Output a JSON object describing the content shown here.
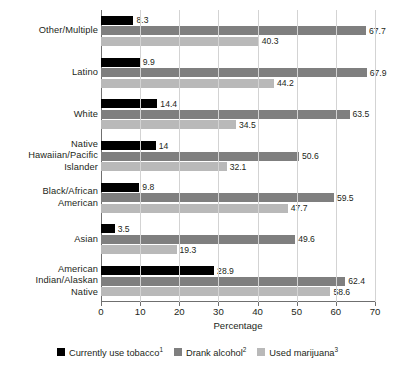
{
  "chart_data": {
    "type": "bar",
    "orientation": "horizontal",
    "title": "",
    "xlabel": "Percentage",
    "ylabel": "",
    "xlim": [
      0,
      70
    ],
    "xticks": [
      0,
      10,
      20,
      30,
      40,
      50,
      60,
      70
    ],
    "grid": "vertical",
    "legend_position": "bottom",
    "categories": [
      "Other/Multiple",
      "Latino",
      "White",
      "Native Hawaiian/Pacific Islander",
      "Black/African American",
      "Asian",
      "American Indian/Alaskan Native"
    ],
    "category_lines": [
      [
        "Other/Multiple"
      ],
      [
        "Latino"
      ],
      [
        "White"
      ],
      [
        "Native",
        "Hawaiian/Pacific",
        "Islander"
      ],
      [
        "Black/African",
        "American"
      ],
      [
        "Asian"
      ],
      [
        "American",
        "Indian/Alaskan",
        "Native"
      ]
    ],
    "series": [
      {
        "name": "Currently use tobacco",
        "footnote": "1",
        "color": "#000000",
        "values": [
          8.3,
          9.9,
          14.4,
          14,
          9.8,
          3.5,
          28.9
        ],
        "labels": [
          "8.3",
          "9.9",
          "14.4",
          "14",
          "9.8",
          "3.5",
          "28.9"
        ]
      },
      {
        "name": "Drank alcohol",
        "footnote": "2",
        "color": "#7f7f7f",
        "values": [
          67.7,
          67.9,
          63.5,
          50.6,
          59.5,
          49.6,
          62.4
        ],
        "labels": [
          "67.7",
          "67.9",
          "63.5",
          "50.6",
          "59.5",
          "49.6",
          "62.4"
        ]
      },
      {
        "name": "Used marijuana",
        "footnote": "3",
        "color": "#b9b9b9",
        "values": [
          40.3,
          44.2,
          34.5,
          32.1,
          47.7,
          19.3,
          58.6
        ],
        "labels": [
          "40.3",
          "44.2",
          "34.5",
          "32.1",
          "47.7",
          "19.3",
          "58.6"
        ]
      }
    ]
  }
}
